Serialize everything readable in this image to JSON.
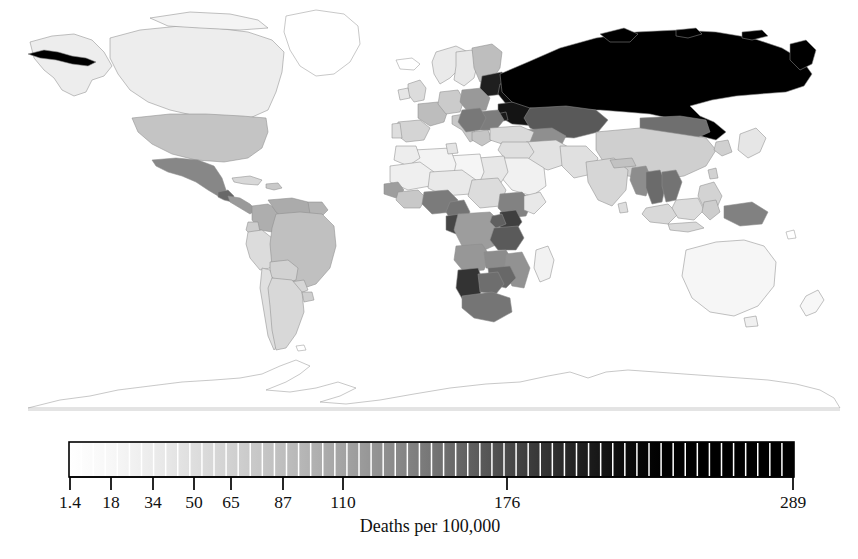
{
  "figure": {
    "kind": "world-choropleth-map",
    "projection_note": "equirectangular world map, grayscale sequential fill"
  },
  "chart_data": {
    "type": "heatmap",
    "title": "",
    "subtitle": "",
    "xlabel": "",
    "ylabel": "",
    "colorbar": {
      "label": "Deaths per 100,000",
      "orientation": "horizontal",
      "min": 1.4,
      "max": 289,
      "segment_count": 60,
      "low_color": "#ffffff",
      "high_color": "#000000",
      "saturation_value": 125,
      "tick_labels": [
        "1.4",
        "18",
        "34",
        "50",
        "65",
        "87",
        "110",
        "176",
        "289"
      ],
      "tick_values": [
        1.4,
        18,
        34,
        50,
        65,
        87,
        110,
        176,
        289
      ],
      "tick_positions_px": [
        70,
        111,
        153,
        194,
        231,
        283,
        343,
        507,
        793
      ],
      "bar_left_px": 69,
      "bar_right_px": 794,
      "bar_top_px": 22,
      "bar_bottom_px": 57
    },
    "legend_position": "below-map",
    "grid": false,
    "regions": [
      {
        "name": "Russian Federation",
        "value": 289,
        "shade": "#000000"
      },
      {
        "name": "Belarus",
        "value": 265,
        "shade": "#0c0c0c"
      },
      {
        "name": "Ukraine",
        "value": 250,
        "shade": "#141414"
      },
      {
        "name": "Republic of Moldova",
        "value": 240,
        "shade": "#1a1a1a"
      },
      {
        "name": "Latvia",
        "value": 235,
        "shade": "#1d1d1d"
      },
      {
        "name": "Lithuania",
        "value": 230,
        "shade": "#202020"
      },
      {
        "name": "Estonia",
        "value": 225,
        "shade": "#232323"
      },
      {
        "name": "Kazakhstan",
        "value": 150,
        "shade": "#595959"
      },
      {
        "name": "Mongolia",
        "value": 120,
        "shade": "#6f6f6f"
      },
      {
        "name": "Namibia",
        "value": 205,
        "shade": "#333333"
      },
      {
        "name": "Kenya",
        "value": 185,
        "shade": "#3f3f3f"
      },
      {
        "name": "United Republic of Tanzania",
        "value": 150,
        "shade": "#5a5a5a"
      },
      {
        "name": "Gabon",
        "value": 175,
        "shade": "#464646"
      },
      {
        "name": "Uganda",
        "value": 140,
        "shade": "#606060"
      },
      {
        "name": "Zimbabwe",
        "value": 130,
        "shade": "#686868"
      },
      {
        "name": "Botswana",
        "value": 120,
        "shade": "#6e6e6e"
      },
      {
        "name": "South Africa",
        "value": 115,
        "shade": "#757575"
      },
      {
        "name": "Nigeria",
        "value": 110,
        "shade": "#7b7b7b"
      },
      {
        "name": "Cameroon",
        "value": 118,
        "shade": "#737373"
      },
      {
        "name": "Ethiopia",
        "value": 105,
        "shade": "#828282"
      },
      {
        "name": "Democratic Republic of the Congo",
        "value": 80,
        "shade": "#9d9d9d"
      },
      {
        "name": "Angola",
        "value": 85,
        "shade": "#979797"
      },
      {
        "name": "Zambia",
        "value": 95,
        "shade": "#8c8c8c"
      },
      {
        "name": "Mozambique",
        "value": 90,
        "shade": "#929292"
      },
      {
        "name": "Madagascar",
        "value": 20,
        "shade": "#f2f2f2"
      },
      {
        "name": "Mexico",
        "value": 100,
        "shade": "#878787"
      },
      {
        "name": "Guatemala",
        "value": 130,
        "shade": "#686868"
      },
      {
        "name": "United States of America",
        "value": 55,
        "shade": "#c4c4c4"
      },
      {
        "name": "Canada",
        "value": 25,
        "shade": "#ededed"
      },
      {
        "name": "Greenland",
        "value": 1.4,
        "shade": "#ffffff"
      },
      {
        "name": "Brazil",
        "value": 58,
        "shade": "#c0c0c0"
      },
      {
        "name": "Venezuela",
        "value": 70,
        "shade": "#ababab"
      },
      {
        "name": "Colombia",
        "value": 68,
        "shade": "#aeaeae"
      },
      {
        "name": "Peru",
        "value": 38,
        "shade": "#dcdcdc"
      },
      {
        "name": "Bolivia",
        "value": 45,
        "shade": "#d2d2d2"
      },
      {
        "name": "Argentina",
        "value": 40,
        "shade": "#d8d8d8"
      },
      {
        "name": "Chile",
        "value": 35,
        "shade": "#e0e0e0"
      },
      {
        "name": "China",
        "value": 48,
        "shade": "#cfcfcf"
      },
      {
        "name": "India",
        "value": 42,
        "shade": "#d6d6d6"
      },
      {
        "name": "Thailand",
        "value": 125,
        "shade": "#6b6b6b"
      },
      {
        "name": "Viet Nam",
        "value": 118,
        "shade": "#737373"
      },
      {
        "name": "Myanmar",
        "value": 95,
        "shade": "#8d8d8d"
      },
      {
        "name": "Papua New Guinea",
        "value": 105,
        "shade": "#818181"
      },
      {
        "name": "Indonesia",
        "value": 40,
        "shade": "#d9d9d9"
      },
      {
        "name": "Philippines",
        "value": 45,
        "shade": "#d3d3d3"
      },
      {
        "name": "Japan",
        "value": 30,
        "shade": "#e6e6e6"
      },
      {
        "name": "Australia",
        "value": 15,
        "shade": "#f6f6f6"
      },
      {
        "name": "New Zealand",
        "value": 14,
        "shade": "#f7f7f7"
      },
      {
        "name": "France",
        "value": 60,
        "shade": "#bdbdbd"
      },
      {
        "name": "Germany",
        "value": 50,
        "shade": "#cbcbcb"
      },
      {
        "name": "Poland",
        "value": 85,
        "shade": "#999999"
      },
      {
        "name": "Romania",
        "value": 110,
        "shade": "#7d7d7d"
      },
      {
        "name": "Hungary",
        "value": 115,
        "shade": "#787878"
      },
      {
        "name": "Finland",
        "value": 60,
        "shade": "#bebebe"
      },
      {
        "name": "Sweden",
        "value": 30,
        "shade": "#e8e8e8"
      },
      {
        "name": "Norway",
        "value": 28,
        "shade": "#eaeaea"
      },
      {
        "name": "Spain",
        "value": 45,
        "shade": "#d4d4d4"
      },
      {
        "name": "Turkey",
        "value": 40,
        "shade": "#dadada"
      },
      {
        "name": "Saudi Arabia",
        "value": 20,
        "shade": "#f1f1f1"
      },
      {
        "name": "Egypt",
        "value": 30,
        "shade": "#e7e7e7"
      },
      {
        "name": "Algeria",
        "value": 18,
        "shade": "#f3f3f3"
      },
      {
        "name": "Libya",
        "value": 16,
        "shade": "#f5f5f5"
      },
      {
        "name": "Antarctica",
        "value": null,
        "shade": "#ffffff"
      }
    ]
  },
  "legend": {
    "caption": "Deaths per 100,000",
    "ticks": [
      {
        "label": "1.4",
        "x": 70
      },
      {
        "label": "18",
        "x": 111
      },
      {
        "label": "34",
        "x": 153
      },
      {
        "label": "50",
        "x": 194
      },
      {
        "label": "65",
        "x": 231
      },
      {
        "label": "87",
        "x": 283
      },
      {
        "label": "110",
        "x": 343
      },
      {
        "label": "176",
        "x": 507
      },
      {
        "label": "289",
        "x": 793
      }
    ]
  },
  "footer": {
    "cut_off_caption": ""
  }
}
